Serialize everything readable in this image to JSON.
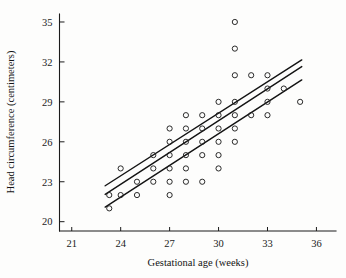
{
  "chart_data": {
    "type": "scatter",
    "title": "",
    "xlabel": "Gestational age (weeks)",
    "ylabel": "Head circumference (centimeters)",
    "xlim": [
      20.25,
      37.2
    ],
    "ylim": [
      19.3,
      35.6
    ],
    "xticks": [
      21,
      24,
      27,
      30,
      33,
      36
    ],
    "xticklabels": [
      "21",
      "24",
      "27",
      "30",
      "33",
      "36"
    ],
    "yticks": [
      20,
      23,
      26,
      29,
      32,
      35
    ],
    "yticklabels": [
      "20",
      "23",
      "26",
      "29",
      "32",
      "35"
    ],
    "grid": false,
    "legend": null,
    "marker": "open-circle",
    "points": [
      [
        23.3,
        22.0
      ],
      [
        23.3,
        21.0
      ],
      [
        24.0,
        24.0
      ],
      [
        24.0,
        22.0
      ],
      [
        25.0,
        22.0
      ],
      [
        25.0,
        23.0
      ],
      [
        26.0,
        25.0
      ],
      [
        26.0,
        24.0
      ],
      [
        26.0,
        23.0
      ],
      [
        27.0,
        27.0
      ],
      [
        27.0,
        26.0
      ],
      [
        27.0,
        25.0
      ],
      [
        27.0,
        24.0
      ],
      [
        27.0,
        23.0
      ],
      [
        27.0,
        22.0
      ],
      [
        28.0,
        28.0
      ],
      [
        28.0,
        27.0
      ],
      [
        28.0,
        26.0
      ],
      [
        28.0,
        25.0
      ],
      [
        28.0,
        24.0
      ],
      [
        28.0,
        23.0
      ],
      [
        29.0,
        28.0
      ],
      [
        29.0,
        27.0
      ],
      [
        29.0,
        26.0
      ],
      [
        29.0,
        25.0
      ],
      [
        29.0,
        23.0
      ],
      [
        30.0,
        29.0
      ],
      [
        30.0,
        28.0
      ],
      [
        30.0,
        27.0
      ],
      [
        30.0,
        26.0
      ],
      [
        30.0,
        25.0
      ],
      [
        30.0,
        24.0
      ],
      [
        31.0,
        35.0
      ],
      [
        31.0,
        33.0
      ],
      [
        31.0,
        31.0
      ],
      [
        31.0,
        29.0
      ],
      [
        31.0,
        28.0
      ],
      [
        31.0,
        27.0
      ],
      [
        31.0,
        26.0
      ],
      [
        32.0,
        31.0
      ],
      [
        32.0,
        28.0
      ],
      [
        33.0,
        31.0
      ],
      [
        33.0,
        30.0
      ],
      [
        33.0,
        29.0
      ],
      [
        33.0,
        28.0
      ],
      [
        34.0,
        30.0
      ],
      [
        35.0,
        29.0
      ]
    ],
    "lines": [
      {
        "name": "upper-confidence-band",
        "x": [
          23.05,
          35.1
        ],
        "y": [
          22.7,
          32.15
        ]
      },
      {
        "name": "regression-line",
        "x": [
          23.05,
          35.1
        ],
        "y": [
          22.05,
          31.65
        ]
      },
      {
        "name": "lower-confidence-band",
        "x": [
          23.05,
          35.1
        ],
        "y": [
          21.1,
          30.65
        ]
      }
    ]
  },
  "axes": {
    "x_title": "Gestational age (weeks)",
    "y_title": "Head circumference (centimeters)"
  }
}
